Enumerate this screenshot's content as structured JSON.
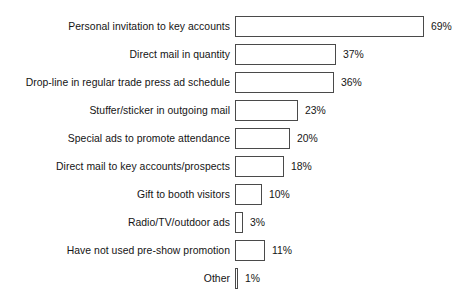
{
  "title_sliver": "",
  "chart_data": {
    "type": "bar",
    "orientation": "horizontal",
    "title": "",
    "xlabel": "",
    "ylabel": "",
    "xlim": [
      0,
      69
    ],
    "grid": false,
    "legend": null,
    "value_suffix": "%",
    "categories": [
      "Personal invitation to key accounts",
      "Direct mail in quantity",
      "Drop-line in regular trade press ad schedule",
      "Stuffer/sticker in outgoing mail",
      "Special ads to promote attendance",
      "Direct mail to key accounts/prospects",
      "Gift to booth visitors",
      "Radio/TV/outdoor ads",
      "Have not used pre-show promotion",
      "Other"
    ],
    "values": [
      69,
      37,
      36,
      23,
      20,
      18,
      10,
      3,
      11,
      1
    ],
    "value_labels": [
      "69%",
      "37%",
      "36%",
      "23%",
      "20%",
      "18%",
      "10%",
      "3%",
      "11%",
      "1%"
    ]
  },
  "rows": [
    {
      "label": "Personal invitation to key accounts",
      "value": 69,
      "value_label": "69%"
    },
    {
      "label": "Direct mail in quantity",
      "value": 37,
      "value_label": "37%"
    },
    {
      "label": "Drop-line in regular trade press ad schedule",
      "value": 36,
      "value_label": "36%"
    },
    {
      "label": "Stuffer/sticker in outgoing mail",
      "value": 23,
      "value_label": "23%"
    },
    {
      "label": "Special ads to promote attendance",
      "value": 20,
      "value_label": "20%"
    },
    {
      "label": "Direct mail to key accounts/prospects",
      "value": 18,
      "value_label": "18%"
    },
    {
      "label": "Gift to booth visitors",
      "value": 10,
      "value_label": "10%"
    },
    {
      "label": "Radio/TV/outdoor ads",
      "value": 3,
      "value_label": "3%"
    },
    {
      "label": "Have not used pre-show promotion",
      "value": 11,
      "value_label": "11%"
    },
    {
      "label": "Other",
      "value": 1,
      "value_label": "1%"
    }
  ],
  "layout": {
    "px_per_percent": 2.74,
    "bar_origin_x": 235,
    "row_pitch": 28,
    "bar_height": 21,
    "value_gap": 7
  },
  "colors": {
    "background": "#ffffff",
    "bar_fill": "#ffffff",
    "bar_stroke": "#4a4a4a",
    "text": "#141414"
  }
}
